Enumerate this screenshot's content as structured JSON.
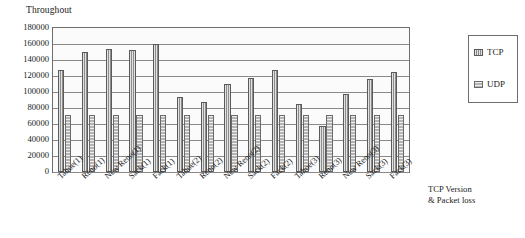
{
  "chart_data": {
    "type": "bar",
    "title": "",
    "ylabel": "Throughout",
    "xlabel": "TCP Version & Packet loss",
    "ylim": [
      0,
      180000
    ],
    "ytick_step": 20000,
    "yticks": [
      "180000",
      "160000",
      "140000",
      "120000",
      "100000",
      "80000",
      "60000",
      "40000",
      "20000",
      "0"
    ],
    "grid": true,
    "legend_position": "right",
    "categories": [
      "Tahoe(1)",
      "Reno(1)",
      "New Reno(1)",
      "Sack(1)",
      "Fack(1)",
      "Tahoe(2)",
      "Reno(2)",
      "New Reno(2)",
      "Sack(2)",
      "Fack(2)",
      "Tahoe(3)",
      "Reno(3)",
      "New Reno(3)",
      "Sack(3)",
      "Fack(3)"
    ],
    "series": [
      {
        "name": "TCP",
        "color": "#8c8c8c",
        "values": [
          127000,
          150000,
          154000,
          153000,
          160000,
          94000,
          88000,
          110000,
          118000,
          127000,
          85000,
          57000,
          97000,
          116000,
          125000
        ]
      },
      {
        "name": "UDP",
        "color": "#b4b4b4",
        "values": [
          71500,
          71500,
          71500,
          71500,
          71500,
          71500,
          71500,
          71500,
          71500,
          71500,
          71500,
          71500,
          71500,
          71500,
          71500
        ]
      }
    ]
  },
  "legend": {
    "entries": [
      {
        "label": "TCP"
      },
      {
        "label": "UDP"
      }
    ]
  }
}
